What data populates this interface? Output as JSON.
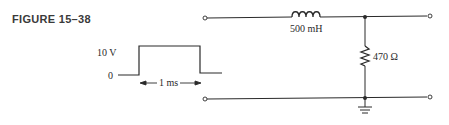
{
  "figure": {
    "label": "FIGURE 15–38"
  },
  "pulse": {
    "high_label": "10 V",
    "low_label": "0",
    "width_label": "1 ms"
  },
  "circuit": {
    "inductor": {
      "value": "500 mH"
    },
    "resistor": {
      "value": "470 Ω"
    }
  },
  "colors": {
    "line": "#2a2a2a",
    "background": "#ffffff"
  }
}
